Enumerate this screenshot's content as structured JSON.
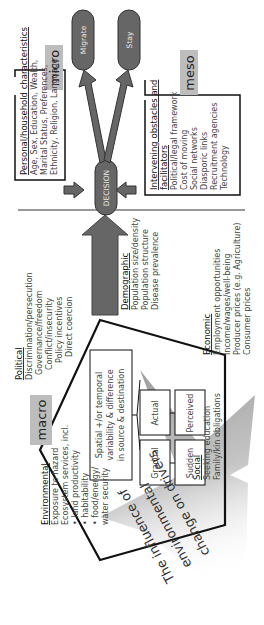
{
  "levels": {
    "micro": "micro",
    "meso": "meso",
    "macro": "macro"
  },
  "outcomes": {
    "migrate": "Migrate",
    "stay": "Stay",
    "decision": "DECISION"
  },
  "micro_box": {
    "title": "Personal/household characteristics",
    "lines": [
      "Age, Sex, Education, Wealth,",
      "Marital Status, Preferences,",
      "Ethnicity, Religion, Language"
    ]
  },
  "meso_box": {
    "title_lines": [
      "Intervening obstacles and",
      "facilitators"
    ],
    "lines": [
      "Political/legal framework",
      "Cost of moving",
      "Social networks",
      "Diasporic links",
      "Recruitment agencies",
      "Technology"
    ]
  },
  "drivers": {
    "political": {
      "title": "Political",
      "lines": [
        "Discrimination/persecution",
        "Governance/freedom",
        "Conflict/insecurity",
        "Policy incentives",
        "Direct coercion"
      ]
    },
    "demographic": {
      "title": "Demographic",
      "lines": [
        "Population size/density",
        "Population structure",
        "Disease prevalence"
      ]
    },
    "economic": {
      "title": "Economic",
      "lines": [
        "Employment opportunities",
        "Income/wages/well-being",
        "Producer prices (e.g. Agriculture)",
        "Consumer prices"
      ]
    },
    "social": {
      "title": "Social",
      "lines": [
        "Seeking education",
        "Family/kin obligations"
      ]
    },
    "environmental": {
      "title": "Environmental",
      "lines": [
        "Exposure to hazard",
        "Ecosystem services, incl.",
        "• land productivity",
        "• habitability",
        "• food/energy/",
        "  water security"
      ]
    }
  },
  "centre": {
    "spatial_lines": [
      "Spatial +/or temporal",
      "variability & difference",
      "in source & destination"
    ],
    "cells": {
      "actual": "Actual",
      "perceived": "Perceived",
      "gradual": "Gradual",
      "sudden": "Sudden"
    }
  },
  "influence": {
    "lines": [
      "The influence of",
      "environmental",
      "change on drivers"
    ]
  }
}
